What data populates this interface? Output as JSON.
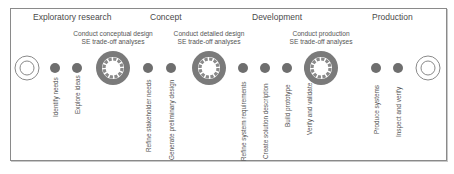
{
  "phases": [
    {
      "label": "Exploratory research",
      "x": 33
    },
    {
      "label": "Concept",
      "x": 150
    },
    {
      "label": "Development",
      "x": 252
    },
    {
      "label": "Production",
      "x": 372
    }
  ],
  "trade_off_analyses": [
    {
      "line1": "Conduct conceptual design",
      "line2": "SE trade-off analyses",
      "x": 113
    },
    {
      "line1": "Conduct detailed design",
      "line2": "SE trade-off analyses",
      "x": 209
    },
    {
      "line1": "Conduct production",
      "line2": "SE trade-off analyses",
      "x": 321
    }
  ],
  "steps": [
    {
      "label": "Identify needs",
      "x": 55
    },
    {
      "label": "Explore ideas",
      "x": 77
    },
    {
      "label": "Refine stakeholder needs",
      "x": 148
    },
    {
      "label": "Generate preliminary design",
      "x": 171
    },
    {
      "label": "Refine system requirements",
      "x": 243
    },
    {
      "label": "Create solution description",
      "x": 265
    },
    {
      "label": "Build prototype",
      "x": 287
    },
    {
      "label": "Verify and validate",
      "x": 309
    },
    {
      "label": "Produce systems",
      "x": 376
    },
    {
      "label": "Inspect and verify",
      "x": 398
    }
  ],
  "endpoints": [
    {
      "name": "start",
      "x": 27
    },
    {
      "name": "end",
      "x": 428
    }
  ],
  "colors": {
    "dot": "#6e6e6e",
    "ring": "#7a7a7a",
    "border": "#8a8a8a",
    "text": "#4a4a4a"
  }
}
